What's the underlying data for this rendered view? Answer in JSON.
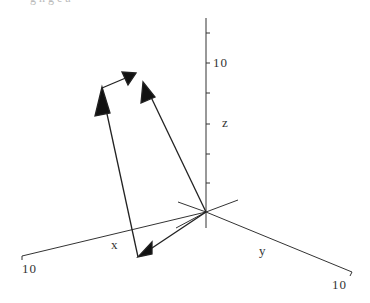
{
  "caption": "g      h  g  e a",
  "axes": {
    "x": {
      "label": "x",
      "tick_label": "10"
    },
    "y": {
      "label": "y",
      "tick_label": "10"
    },
    "z": {
      "label": "z",
      "tick_label": "10"
    }
  },
  "vectors": [
    {
      "name": "vector-origin-to-x",
      "from": "origin",
      "to": "point on x side"
    },
    {
      "name": "vector-up-left",
      "from": "x-side point",
      "to": "upper-left point"
    },
    {
      "name": "vector-short-top",
      "from": "upper-left point",
      "to": "top point"
    },
    {
      "name": "vector-origin-to-top",
      "from": "origin",
      "to": "top point"
    }
  ],
  "colors": {
    "line": "#222222",
    "axis": "#333333",
    "text": "#333333"
  }
}
